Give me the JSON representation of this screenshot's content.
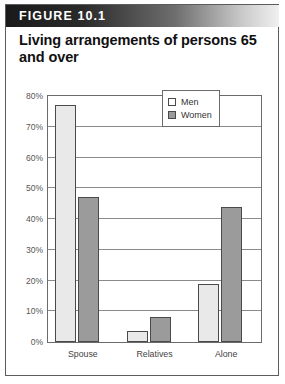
{
  "figure": {
    "header_label": "FIGURE 10.1",
    "title": "Living arrangements of persons 65 and over"
  },
  "legend": {
    "position": "top-right-inside",
    "entries": [
      {
        "label": "Men",
        "color": "#ffffff"
      },
      {
        "label": "Women",
        "color": "#9b9b9b"
      }
    ]
  },
  "chart_data": {
    "type": "bar",
    "title": "Living arrangements of persons 65 and over",
    "xlabel": "",
    "ylabel": "",
    "ylim": [
      0,
      80
    ],
    "ytick_step": 10,
    "ytick_labels": [
      "0%",
      "10%",
      "20%",
      "30%",
      "40%",
      "50%",
      "60%",
      "70%",
      "80%"
    ],
    "ytick_values": [
      0,
      10,
      20,
      30,
      40,
      50,
      60,
      70,
      80
    ],
    "grid": true,
    "legend": "top-right",
    "categories": [
      "Spouse",
      "Relatives",
      "Alone"
    ],
    "series": [
      {
        "name": "Men",
        "color": "#e9e9e9",
        "values": [
          77,
          3.5,
          19
        ]
      },
      {
        "name": "Women",
        "color": "#9b9b9b",
        "values": [
          47,
          8,
          44
        ]
      }
    ]
  }
}
